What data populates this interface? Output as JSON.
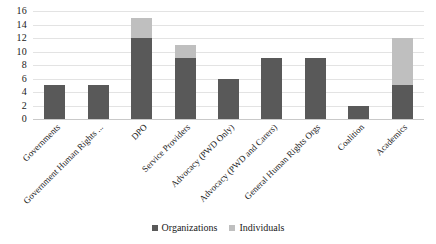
{
  "chart_data": {
    "type": "bar",
    "subtype": "stacked-bar",
    "title": "",
    "xlabel": "",
    "ylabel": "",
    "ylim": [
      0,
      16
    ],
    "ytick_step": 2,
    "yticks": [
      16,
      14,
      12,
      10,
      8,
      6,
      4,
      2,
      0
    ],
    "grid": true,
    "grid_axis": "y",
    "legend_position": "bottom-center",
    "categories": [
      "Governments",
      "Government Human Rights ...",
      "DPO",
      "Service Providers",
      "Advocacy (PWD Only)",
      "Advocacy (PWD and Carers)",
      "General Human Rights Orgs",
      "Coalition",
      "Academics"
    ],
    "series": [
      {
        "name": "Organizations",
        "color": "#595959",
        "values": [
          5,
          5,
          12,
          9,
          6,
          9,
          9,
          2,
          5
        ]
      },
      {
        "name": "Individuals",
        "color": "#bfbfbf",
        "values": [
          0,
          0,
          3,
          2,
          0,
          0,
          0,
          0,
          7
        ]
      }
    ],
    "totals": [
      5,
      5,
      15,
      11,
      6,
      9,
      9,
      2,
      12
    ]
  },
  "legend": {
    "items": [
      {
        "label": "Organizations",
        "swatch": "org"
      },
      {
        "label": "Individuals",
        "swatch": "ind"
      }
    ]
  },
  "colors": {
    "organizations": "#595959",
    "individuals": "#bfbfbf",
    "gridline": "#e3e3e3",
    "axis": "#c9c9c9",
    "text": "#1a1a1a",
    "background": "#ffffff"
  }
}
